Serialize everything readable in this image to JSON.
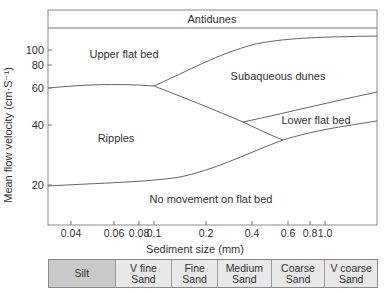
{
  "chart_data": {
    "type": "diagram-regions",
    "title": "",
    "xlabel": "Sediment size (mm)",
    "ylabel": "Mean flow velocity (cm·S⁻¹)",
    "xscale": "log",
    "yscale": "log",
    "xticks": [
      "0.04",
      "0.06",
      "0.08",
      "0.1",
      "0.2",
      "0.4",
      "0.6",
      "0.8",
      "1.0"
    ],
    "yticks": [
      "100",
      "80",
      "60",
      "40",
      "20"
    ],
    "regions": [
      {
        "name": "Antidunes"
      },
      {
        "name": "Upper flat bed"
      },
      {
        "name": "Subaqueous dunes"
      },
      {
        "name": "Lower flat bed"
      },
      {
        "name": "Ripples"
      },
      {
        "name": "No movement on flat bed"
      }
    ],
    "boundaries": [
      {
        "name": "upper-flat-bed / ripples",
        "points": [
          [
            0.03,
            60
          ],
          [
            0.06,
            62
          ],
          [
            0.1,
            60
          ]
        ]
      },
      {
        "name": "upper-flat-bed / dunes",
        "points": [
          [
            0.1,
            60
          ],
          [
            0.3,
            95
          ],
          [
            1.0,
            108
          ],
          [
            2.0,
            110
          ]
        ]
      },
      {
        "name": "ripples / dunes",
        "points": [
          [
            0.1,
            60
          ],
          [
            0.2,
            50
          ],
          [
            0.4,
            40
          ],
          [
            0.6,
            34
          ]
        ]
      },
      {
        "name": "dunes / lower-flat-bed",
        "points": [
          [
            0.4,
            40
          ],
          [
            1.0,
            48
          ],
          [
            2.0,
            56
          ]
        ]
      },
      {
        "name": "ripples / no-movement",
        "points": [
          [
            0.03,
            20
          ],
          [
            0.1,
            21
          ],
          [
            0.2,
            24
          ],
          [
            0.6,
            34
          ],
          [
            1.0,
            37
          ],
          [
            2.0,
            40
          ]
        ]
      }
    ]
  },
  "labels": {
    "antidunes": "Antidunes",
    "upper_flat_bed": "Upper flat bed",
    "subaqueous_dunes": "Subaqueous dunes",
    "lower_flat_bed": "Lower flat bed",
    "ripples": "Ripples",
    "no_movement": "No movement on flat bed",
    "xlabel": "Sediment size (mm)",
    "ylabel": "Mean flow velocity (cm·S⁻¹)"
  },
  "xticks": [
    {
      "label": "0.04",
      "x": 71
    },
    {
      "label": "0.06",
      "x": 114
    },
    {
      "label": "0.08",
      "x": 139
    },
    {
      "label": "0.1",
      "x": 154
    },
    {
      "label": "0.2",
      "x": 206
    },
    {
      "label": "0.4",
      "x": 252
    },
    {
      "label": "0.6",
      "x": 288
    },
    {
      "label": "0.8",
      "x": 310
    },
    {
      "label": "1.0",
      "x": 325
    }
  ],
  "yticks": [
    {
      "label": "100",
      "y": 50
    },
    {
      "label": "80",
      "y": 65
    },
    {
      "label": "60",
      "y": 88
    },
    {
      "label": "40",
      "y": 125
    },
    {
      "label": "20",
      "y": 185
    }
  ],
  "size_classes": [
    {
      "line1": "Silt",
      "line2": "",
      "width": 67,
      "dark": true
    },
    {
      "line1": "V fine",
      "line2": "Sand",
      "width": 57,
      "dark": false
    },
    {
      "line1": "Fine",
      "line2": "Sand",
      "width": 46,
      "dark": false
    },
    {
      "line1": "Medium",
      "line2": "Sand",
      "width": 54,
      "dark": false
    },
    {
      "line1": "Coarse",
      "line2": "Sand",
      "width": 54,
      "dark": false
    },
    {
      "line1": "V coarse",
      "line2": "Sand",
      "width": 52,
      "dark": false
    }
  ]
}
